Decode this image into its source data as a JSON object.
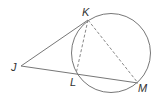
{
  "diagram": {
    "type": "circle-tangent-secant",
    "colors": {
      "stroke": "#777777",
      "label": "#333333"
    },
    "circle": {
      "cx": 111,
      "cy": 53,
      "r": 39.5
    },
    "points": {
      "J": {
        "label": "J",
        "x": 21,
        "y": 66
      },
      "K": {
        "label": "K",
        "x": 88,
        "y": 20
      },
      "L": {
        "label": "L",
        "x": 76,
        "y": 74
      },
      "M": {
        "label": "M",
        "x": 138,
        "y": 83
      }
    },
    "segments": [
      {
        "from": "J",
        "to": "K",
        "style": "solid"
      },
      {
        "from": "J",
        "to": "M",
        "style": "solid"
      },
      {
        "from": "K",
        "to": "L",
        "style": "dashed"
      },
      {
        "from": "K",
        "to": "M",
        "style": "dashed"
      }
    ]
  }
}
